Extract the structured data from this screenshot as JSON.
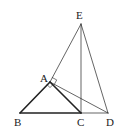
{
  "diagram": {
    "type": "geometry",
    "points": {
      "A": {
        "label": "A",
        "x": 50,
        "y": 82
      },
      "B": {
        "label": "B",
        "x": 20,
        "y": 113
      },
      "C": {
        "label": "C",
        "x": 81,
        "y": 113
      },
      "D": {
        "label": "D",
        "x": 108,
        "y": 113
      },
      "E": {
        "label": "E",
        "x": 81,
        "y": 24
      }
    },
    "segments": [
      {
        "from": "A",
        "to": "B",
        "weight": "bold"
      },
      {
        "from": "A",
        "to": "C",
        "weight": "bold"
      },
      {
        "from": "B",
        "to": "C",
        "weight": "bold"
      },
      {
        "from": "C",
        "to": "D",
        "weight": "thin"
      },
      {
        "from": "E",
        "to": "C",
        "weight": "thin"
      },
      {
        "from": "E",
        "to": "D",
        "weight": "thin"
      },
      {
        "from": "E",
        "to": "A",
        "weight": "thin"
      },
      {
        "from": "A",
        "to": "D",
        "weight": "thin"
      }
    ],
    "right_angle_marks": [
      "A (between AE and AD)",
      "A (between AB and AC)"
    ],
    "colors": {
      "line": "#222222",
      "background": "#ffffff"
    }
  }
}
